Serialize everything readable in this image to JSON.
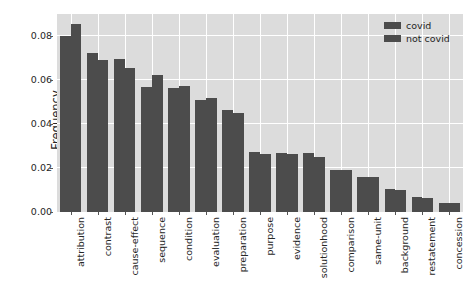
{
  "chart_data": {
    "type": "bar",
    "title": "",
    "xlabel": "",
    "ylabel": "Frequency",
    "ylim": [
      0.0,
      0.09
    ],
    "yticks": [
      0.0,
      0.02,
      0.04,
      0.06,
      0.08
    ],
    "ytick_labels": [
      "0.00",
      "0.02",
      "0.04",
      "0.06",
      "0.08"
    ],
    "grid": true,
    "legend_position": "upper right",
    "categories": [
      "attribution",
      "contrast",
      "cause-effect",
      "sequence",
      "condition",
      "evaluation",
      "preparation",
      "purpose",
      "evidence",
      "solutionhood",
      "comparison",
      "same-unit",
      "background",
      "restatement",
      "concession"
    ],
    "series": [
      {
        "name": "covid",
        "color": "#4c4c4c",
        "values": [
          0.08,
          0.0721,
          0.0695,
          0.057,
          0.0562,
          0.051,
          0.0465,
          0.0272,
          0.027,
          0.0268,
          0.0192,
          0.016,
          0.0105,
          0.0068,
          0.0042
        ]
      },
      {
        "name": "not covid",
        "color": "#4c4c4c",
        "values": [
          0.0855,
          0.0689,
          0.0655,
          0.0625,
          0.0575,
          0.0518,
          0.045,
          0.0262,
          0.0265,
          0.0252,
          0.019,
          0.0158,
          0.0098,
          0.0065,
          0.004
        ]
      }
    ]
  },
  "legend": {
    "items": [
      {
        "label": "covid"
      },
      {
        "label": "not covid"
      }
    ]
  }
}
